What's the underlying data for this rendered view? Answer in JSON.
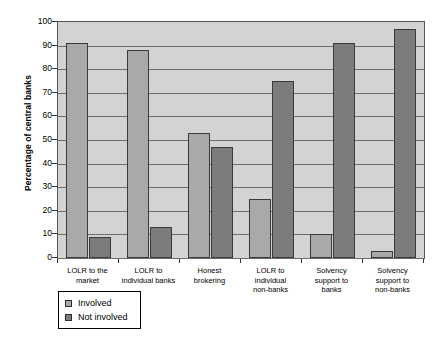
{
  "chart_data": {
    "type": "bar",
    "title": "",
    "xlabel": "",
    "ylabel": "Percentage of central banks",
    "ylim": [
      0,
      100
    ],
    "ytick_values": [
      0,
      10,
      20,
      30,
      40,
      50,
      60,
      70,
      80,
      90,
      100
    ],
    "ytick_labels": [
      "0",
      "10",
      "20",
      "30",
      "40",
      "50",
      "60",
      "70",
      "80",
      "90",
      "100"
    ],
    "grid": true,
    "legend_position": "below-left",
    "categories": [
      "LOLR to the market",
      "LOLR to individual banks",
      "Honest brokering",
      "LOLR to individual non-banks",
      "Solvency support to banks",
      "Solvency support to non-banks"
    ],
    "category_lines": [
      [
        "LOLR to the",
        "market"
      ],
      [
        "LOLR to",
        "individual banks"
      ],
      [
        "Honest",
        "brokering"
      ],
      [
        "LOLR to",
        "individual",
        "non-banks"
      ],
      [
        "Solvency",
        "support to",
        "banks"
      ],
      [
        "Solvency",
        "support to",
        "non-banks"
      ]
    ],
    "series": [
      {
        "name": "Involved",
        "color": "#a9a9a9",
        "values": [
          91,
          88,
          53,
          25,
          10,
          3
        ]
      },
      {
        "name": "Not involved",
        "color": "#7c7c7c",
        "values": [
          9,
          13,
          47,
          75,
          91,
          97
        ]
      }
    ]
  },
  "legend": {
    "items": [
      {
        "label": "Involved",
        "swatch": "involved"
      },
      {
        "label": "Not involved",
        "swatch": "not-involved"
      }
    ]
  },
  "caption": {
    "text": ""
  },
  "colors": {
    "plot_background": "#d3d3d3",
    "gridline": "#6d6d6d",
    "involved": "#a9a9a9",
    "not_involved": "#7c7c7c",
    "axis": "#555555"
  }
}
